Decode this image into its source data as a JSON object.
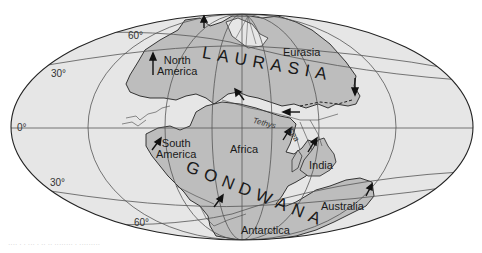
{
  "map": {
    "title": "Pangaea supercontinent",
    "colors": {
      "ocean": "#e6e6e6",
      "land": "#bdbdbd",
      "grid": "#555555",
      "outline": "#222222",
      "background": "#ffffff"
    },
    "latitude_labels": {
      "n60": "60°",
      "n30": "30°",
      "eq": "0°",
      "s30": "30°",
      "s60": "60°"
    },
    "supercontinents": {
      "north": "LAURASIA",
      "south": "GONDWANA"
    },
    "continents": {
      "north_america_line1": "North",
      "north_america_line2": "America",
      "eurasia": "Eurasia",
      "south_america_line1": "South",
      "south_america_line2": "America",
      "africa": "Africa",
      "india": "India",
      "australia": "Australia",
      "antarctica": "Antarctica"
    },
    "sea": {
      "word1": "Tethys",
      "word2": "Sea"
    },
    "caption": "···· · · ··· · ·· ·· ········ · ·········"
  }
}
